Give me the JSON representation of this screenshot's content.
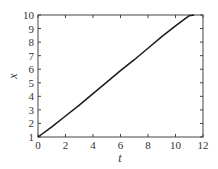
{
  "chart_data": {
    "type": "line",
    "title": "",
    "xlabel": "t",
    "ylabel": "x",
    "xlim": [
      0,
      12
    ],
    "ylim": [
      1,
      10
    ],
    "xticks": [
      0,
      2,
      4,
      6,
      8,
      10,
      12
    ],
    "yticks": [
      1,
      2,
      3,
      4,
      5,
      6,
      7,
      8,
      9,
      10
    ],
    "grid": false,
    "legend": null,
    "series": [
      {
        "name": "x(t)",
        "color": "#1a1a1a",
        "x": [
          0,
          1,
          2,
          3,
          4,
          5,
          6,
          7,
          8,
          9,
          10,
          11,
          11.35
        ],
        "y": [
          1.0,
          1.75,
          2.55,
          3.35,
          4.2,
          5.05,
          5.9,
          6.7,
          7.55,
          8.4,
          9.2,
          9.95,
          10.0
        ]
      }
    ]
  }
}
